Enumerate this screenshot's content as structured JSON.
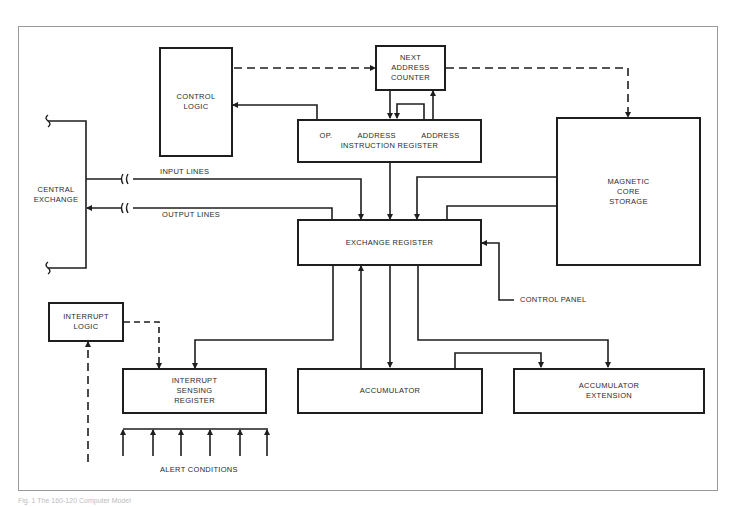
{
  "diagram": {
    "caption": "Fig. 1 The 160-120 Computer Model",
    "blocks": {
      "control_logic": "CONTROL\nLOGIC",
      "next_address_counter": "NEXT\nADDRESS\nCOUNTER",
      "instruction_register": {
        "fields": [
          "OP.",
          "ADDRESS",
          "ADDRESS"
        ],
        "name": "INSTRUCTION REGISTER"
      },
      "magnetic_core_storage": "MAGNETIC\nCORE\nSTORAGE",
      "central_exchange": "CENTRAL\nEXCHANGE",
      "exchange_register": "EXCHANGE REGISTER",
      "interrupt_logic": "INTERRUPT\nLOGIC",
      "interrupt_sensing_register": "INTERRUPT\nSENSING\nREGISTER",
      "accumulator": "ACCUMULATOR",
      "accumulator_extension": "ACCUMULATOR\nEXTENSION"
    },
    "labels": {
      "input_lines": "INPUT LINES",
      "output_lines": "OUTPUT LINES",
      "control_panel": "CONTROL PANEL",
      "alert_conditions": "ALERT CONDITIONS"
    },
    "alert_condition_count": 6,
    "connections": [
      {
        "from": "control_logic",
        "to": "next_address_counter",
        "style": "dashed"
      },
      {
        "from": "next_address_counter",
        "to": "magnetic_core_storage",
        "style": "dashed"
      },
      {
        "from": "instruction_register",
        "to": "control_logic",
        "style": "solid"
      },
      {
        "from": "next_address_counter",
        "to": "instruction_register",
        "style": "solid"
      },
      {
        "from": "instruction_register",
        "to": "next_address_counter",
        "style": "solid"
      },
      {
        "from": "instruction_register",
        "to": "exchange_register",
        "style": "solid"
      },
      {
        "from": "central_exchange",
        "to": "exchange_register",
        "label": "INPUT LINES",
        "style": "solid"
      },
      {
        "from": "exchange_register",
        "to": "central_exchange",
        "label": "OUTPUT LINES",
        "style": "solid"
      },
      {
        "from": "magnetic_core_storage",
        "to": "exchange_register",
        "style": "solid"
      },
      {
        "from": "exchange_register",
        "to": "magnetic_core_storage",
        "style": "solid"
      },
      {
        "from": "control_panel",
        "to": "exchange_register",
        "style": "solid"
      },
      {
        "from": "exchange_register",
        "to": "interrupt_sensing_register",
        "style": "solid"
      },
      {
        "from": "accumulator",
        "to": "exchange_register",
        "style": "solid"
      },
      {
        "from": "exchange_register",
        "to": "accumulator",
        "style": "solid"
      },
      {
        "from": "exchange_register",
        "to": "accumulator_extension",
        "style": "solid"
      },
      {
        "from": "accumulator",
        "to": "accumulator_extension",
        "style": "solid"
      },
      {
        "from": "interrupt_logic",
        "to": "interrupt_sensing_register",
        "style": "dashed"
      },
      {
        "from": "alert_conditions",
        "to": "interrupt_logic",
        "style": "dashed"
      },
      {
        "from": "alert_conditions",
        "to": "interrupt_sensing_register",
        "style": "solid"
      }
    ]
  }
}
